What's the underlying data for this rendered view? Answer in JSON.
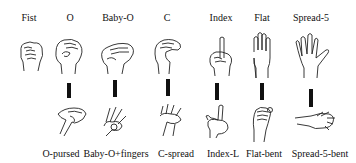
{
  "top_labels": [
    "Fist",
    "O",
    "Baby-O",
    "C",
    "Index",
    "Flat",
    "Spread-5"
  ],
  "bottom_labels": [
    "O-pursed",
    "Baby-O+fingers",
    "C-spread",
    "Index-L",
    "Flat-bent",
    "Spread-5-bent"
  ],
  "transitions": [
    {
      "from": "O",
      "to": "O-pursed"
    },
    {
      "from": "Baby-O",
      "to": "Baby-O+fingers"
    },
    {
      "from": "C",
      "to": "C-spread"
    },
    {
      "from": "Index",
      "to": "Index-L"
    },
    {
      "from": "Flat",
      "to": "Flat-bent"
    },
    {
      "from": "Spread-5",
      "to": "Spread-5-bent"
    }
  ]
}
